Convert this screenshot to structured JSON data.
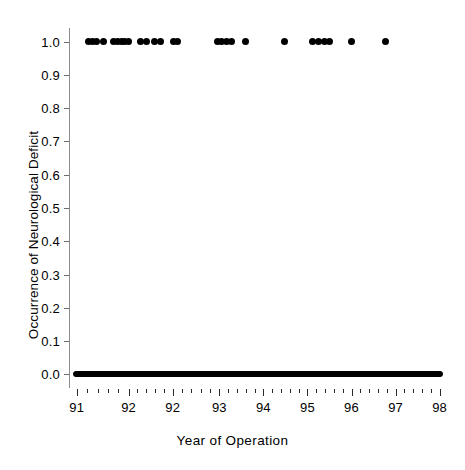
{
  "figure": {
    "width": 465,
    "height": 470,
    "background": "#ffffff",
    "marker_color": "#000000",
    "axis_color": "#8c8c8c"
  },
  "axis_titles": {
    "y": "Occurrence of Neurological Deficit",
    "x_word1": "Year",
    "x_word2": "of",
    "x_word3": "Operation",
    "x_full": "Year of Operation"
  },
  "y_ticks": [
    {
      "label": "0.0",
      "value": 0.0
    },
    {
      "label": "0.1",
      "value": 0.1
    },
    {
      "label": "0.2",
      "value": 0.2
    },
    {
      "label": "0.3",
      "value": 0.3
    },
    {
      "label": "0.4",
      "value": 0.4
    },
    {
      "label": "0.5",
      "value": 0.5
    },
    {
      "label": "0.6",
      "value": 0.6
    },
    {
      "label": "0.7",
      "value": 0.7
    },
    {
      "label": "0.8",
      "value": 0.8
    },
    {
      "label": "0.9",
      "value": 0.9
    },
    {
      "label": "1.0",
      "value": 1.0
    }
  ],
  "x_ticks": [
    {
      "label": "91",
      "pos": 91.0
    },
    {
      "label": "92",
      "pos": 92.0
    },
    {
      "label": "92",
      "pos": 92.85
    },
    {
      "label": "93",
      "pos": 93.75
    },
    {
      "label": "94",
      "pos": 94.6
    },
    {
      "label": "95",
      "pos": 95.45
    },
    {
      "label": "96",
      "pos": 96.3
    },
    {
      "label": "97",
      "pos": 97.15
    },
    {
      "label": "98",
      "pos": 98.0
    }
  ],
  "chart_data": {
    "type": "scatter",
    "title": "",
    "subtitle": "",
    "xlabel": "Year of Operation",
    "ylabel": "Occurrence of Neurological Deficit",
    "xlim": [
      90.85,
      98.2
    ],
    "ylim": [
      -0.035,
      1.035
    ],
    "grid": false,
    "legend": null,
    "marker": "filled-circle",
    "marker_color": "#000000",
    "marker_size_px": 7,
    "annotations": [],
    "series": [
      {
        "name": "Deficit occurred (y = 1)",
        "y": 1.0,
        "count": 31,
        "x": [
          91.22,
          91.3,
          91.38,
          91.52,
          91.7,
          91.78,
          91.86,
          91.93,
          92.0,
          92.22,
          92.34,
          92.5,
          92.62,
          92.86,
          92.95,
          93.72,
          93.8,
          93.88,
          93.99,
          94.25,
          95.0,
          95.55,
          95.66,
          95.77,
          95.88,
          96.3,
          96.95
        ]
      },
      {
        "name": "No deficit (y = 0)",
        "y": 0.0,
        "count": 430,
        "x_range": [
          91.0,
          98.0
        ],
        "description": "Continuous dense band of overlapping markers from 91 to 98"
      }
    ]
  }
}
